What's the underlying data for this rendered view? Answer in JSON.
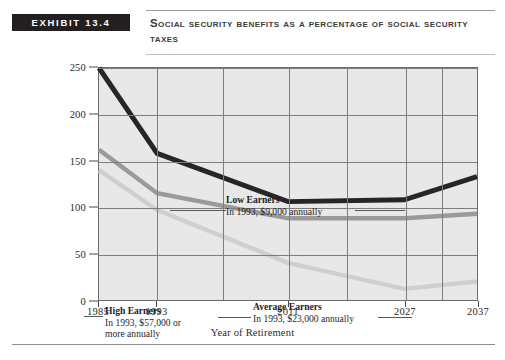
{
  "header": {
    "exhibit_label": "EXHIBIT 13.4",
    "title": "Social Security Benefits as a Percentage of Social Security Taxes"
  },
  "chart_data": {
    "type": "line",
    "title": "Social Security Benefits as a Percentage of Social Security Taxes",
    "xlabel": "Year of Retirement",
    "ylabel": "",
    "x": [
      1985,
      1993,
      2011,
      2027,
      2037
    ],
    "xtick_labels": [
      "1985",
      "1993",
      "2011",
      "2027",
      "2037"
    ],
    "ytick_labels": [
      "0",
      "50",
      "100",
      "150",
      "200",
      "250"
    ],
    "yticks": [
      0,
      50,
      100,
      150,
      200,
      250
    ],
    "xlim": [
      1985,
      2037
    ],
    "ylim": [
      0,
      250
    ],
    "grid": true,
    "legend_position": "inline-annotations",
    "series": [
      {
        "name": "Low Earners",
        "color": "#262626",
        "values": [
          250,
          158,
          106,
          108,
          133
        ]
      },
      {
        "name": "Average Earners",
        "color": "#9a9a9a",
        "values": [
          162,
          115,
          88,
          88,
          93
        ]
      },
      {
        "name": "High Earners",
        "color": "#cfcfcf",
        "values": [
          140,
          97,
          40,
          12,
          20
        ]
      }
    ],
    "annotations": [
      {
        "id": "low",
        "heading": "Low Earners",
        "detail": "In 1993, $9,000 annually"
      },
      {
        "id": "high",
        "heading": "High Earners",
        "detail_line1": "In 1993, $57,000 or",
        "detail_line2": "more annually"
      },
      {
        "id": "average",
        "heading": "Average Earners",
        "detail": "In 1993, $23,000 annually"
      }
    ]
  }
}
